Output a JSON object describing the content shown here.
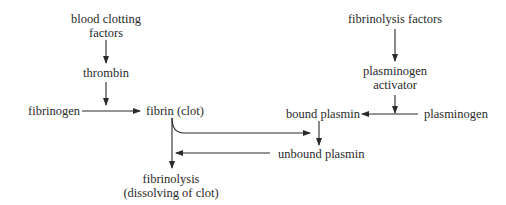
{
  "diagram": {
    "nodes": {
      "blood_clotting_factors": {
        "line1": "blood clotting",
        "line2": "factors"
      },
      "thrombin": "thrombin",
      "fibrinogen": "fibrinogen",
      "fibrin_clot": "fibrin (clot)",
      "fibrinolysis": {
        "line1": "fibrinolysis",
        "line2": "(dissolving of clot)"
      },
      "fibrinolysis_factors": "fibrinolysis factors",
      "plasminogen_activator": {
        "line1": "plasminogen",
        "line2": "activator"
      },
      "bound_plasmin": "bound plasmin",
      "plasminogen": "plasminogen",
      "unbound_plasmin": "unbound plasmin"
    },
    "edges": [
      {
        "from": "blood clotting factors",
        "to": "thrombin"
      },
      {
        "from": "thrombin",
        "to": "fibrinogen→fibrin conversion"
      },
      {
        "from": "fibrinogen",
        "to": "fibrin (clot)"
      },
      {
        "from": "fibrin (clot)",
        "to": "fibrinolysis (dissolving of clot)"
      },
      {
        "from": "fibrin (clot)",
        "to": "bound plasmin arrow"
      },
      {
        "from": "fibrinolysis factors",
        "to": "plasminogen activator"
      },
      {
        "from": "plasminogen activator",
        "to": "plasminogen→bound plasmin conversion"
      },
      {
        "from": "plasminogen",
        "to": "bound plasmin"
      },
      {
        "from": "bound plasmin",
        "to": "unbound plasmin"
      },
      {
        "from": "unbound plasmin",
        "to": "fibrinolysis arrow"
      }
    ],
    "colors": {
      "ink": "#2a2a2a",
      "background": "#ffffff"
    }
  }
}
